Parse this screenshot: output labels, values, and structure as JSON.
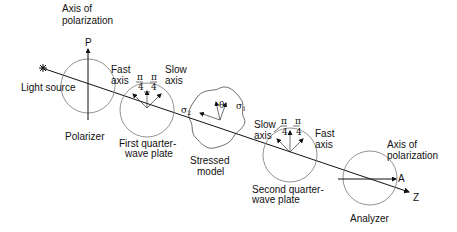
{
  "diagram": {
    "type": "circular polariscope schematic",
    "light_source": {
      "label": "Light source",
      "icon": "star-burst-icon"
    },
    "polarizer": {
      "label": "Polarizer",
      "axis_label": "Axis of polarization",
      "axis_letter": "P"
    },
    "first_qwp": {
      "label_line1": "First quarter-",
      "label_line2": "wave plate",
      "fast_axis_line1": "Fast",
      "fast_axis_line2": "axis",
      "slow_axis_line1": "Slow",
      "slow_axis_line2": "axis",
      "angle_num": "π",
      "angle_den": "4"
    },
    "stressed_model": {
      "label_line1": "Stressed",
      "label_line2": "model",
      "sigma1": "σ",
      "sigma1_sub": "1",
      "sigma2": "σ",
      "sigma2_sub": "2",
      "angle_symbol": "θ"
    },
    "second_qwp": {
      "label_line1": "Second quarter-",
      "label_line2": "wave plate",
      "slow_axis_line1": "Slow",
      "slow_axis_line2": "axis",
      "fast_axis_line1": "Fast",
      "fast_axis_line2": "axis",
      "angle_num": "π",
      "angle_den": "4"
    },
    "analyzer": {
      "label": "Analyzer",
      "axis_label_line1": "Axis of",
      "axis_label_line2": "polarization",
      "axis_letter": "A"
    },
    "propagation_axis": {
      "letter": "Z"
    },
    "top_axis_label_line1": "Axis of",
    "top_axis_label_line2": "polarization"
  }
}
